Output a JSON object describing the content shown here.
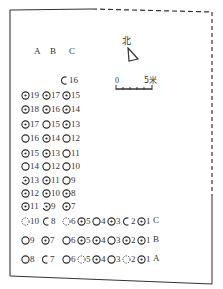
{
  "diagram": {
    "north_label": "北",
    "scale": {
      "start": "0",
      "end": "5米"
    },
    "column_headers": [
      "A",
      "B",
      "C"
    ],
    "row_labels": {
      "C": "C",
      "B": "B",
      "A": "A"
    },
    "vertical_rows": [
      {
        "y": 75,
        "cells": [
          {
            "col": "C",
            "x": 60,
            "n": "16",
            "type": "half"
          }
        ]
      },
      {
        "y": 90,
        "cells": [
          {
            "col": "A",
            "x": 21,
            "n": "19",
            "type": "dot"
          },
          {
            "col": "B",
            "x": 42,
            "n": "17",
            "type": "dot"
          },
          {
            "col": "C",
            "x": 62,
            "n": "15",
            "type": "dot"
          }
        ]
      },
      {
        "y": 104,
        "cells": [
          {
            "col": "A",
            "x": 21,
            "n": "18",
            "type": "dot"
          },
          {
            "col": "B",
            "x": 42,
            "n": "16",
            "type": "dot"
          },
          {
            "col": "C",
            "x": 62,
            "n": "14",
            "type": "dot"
          }
        ]
      },
      {
        "y": 119,
        "cells": [
          {
            "col": "A",
            "x": 21,
            "n": "17",
            "type": "dot"
          },
          {
            "col": "B",
            "x": 42,
            "n": "15",
            "type": "plain"
          },
          {
            "col": "C",
            "x": 62,
            "n": "13",
            "type": "dot"
          }
        ]
      },
      {
        "y": 133,
        "cells": [
          {
            "col": "A",
            "x": 21,
            "n": "16",
            "type": "plain"
          },
          {
            "col": "B",
            "x": 42,
            "n": "14",
            "type": "dot"
          },
          {
            "col": "C",
            "x": 62,
            "n": "12",
            "type": "plain"
          }
        ]
      },
      {
        "y": 148,
        "cells": [
          {
            "col": "A",
            "x": 21,
            "n": "15",
            "type": "dot"
          },
          {
            "col": "B",
            "x": 42,
            "n": "13",
            "type": "dot"
          },
          {
            "col": "C",
            "x": 62,
            "n": "11",
            "type": "plain"
          }
        ]
      },
      {
        "y": 161,
        "cells": [
          {
            "col": "A",
            "x": 21,
            "n": "14",
            "type": "plain"
          },
          {
            "col": "B",
            "x": 42,
            "n": "12",
            "type": "plain"
          },
          {
            "col": "C",
            "x": 62,
            "n": "10",
            "type": "plain"
          }
        ]
      },
      {
        "y": 175,
        "cells": [
          {
            "col": "A",
            "x": 21,
            "n": "13",
            "type": "brokendot"
          },
          {
            "col": "B",
            "x": 42,
            "n": "11",
            "type": "dot"
          },
          {
            "col": "C",
            "x": 62,
            "n": "9",
            "type": "plain"
          }
        ]
      },
      {
        "y": 188,
        "cells": [
          {
            "col": "A",
            "x": 21,
            "n": "12",
            "type": "dot"
          },
          {
            "col": "B",
            "x": 42,
            "n": "10",
            "type": "dot"
          },
          {
            "col": "C",
            "x": 62,
            "n": "8",
            "type": "dot"
          }
        ]
      },
      {
        "y": 201,
        "cells": [
          {
            "col": "A",
            "x": 21,
            "n": "11",
            "type": "dot"
          },
          {
            "col": "B",
            "x": 42,
            "n": "9",
            "type": "brokendot"
          },
          {
            "col": "C",
            "x": 62,
            "n": "7",
            "type": "dot"
          }
        ]
      }
    ],
    "horizontal_rows": [
      {
        "row": "C",
        "y": 216,
        "cells": [
          {
            "x": 21,
            "n": "10",
            "type": "dashed"
          },
          {
            "x": 42,
            "n": "8",
            "type": "half"
          },
          {
            "x": 62,
            "n": "6",
            "type": "dashed"
          },
          {
            "x": 77,
            "n": "5",
            "type": "dot"
          },
          {
            "x": 92,
            "n": "4",
            "type": "plain"
          },
          {
            "x": 107,
            "n": "3",
            "type": "dot"
          },
          {
            "x": 122,
            "n": "2",
            "type": "half"
          },
          {
            "x": 137,
            "n": "1",
            "type": "dot"
          }
        ]
      },
      {
        "row": "B",
        "y": 235,
        "cells": [
          {
            "x": 21,
            "n": "9",
            "type": "plain"
          },
          {
            "x": 41,
            "n": "7",
            "type": "dot"
          },
          {
            "x": 62,
            "n": "6",
            "type": "plain"
          },
          {
            "x": 77,
            "n": "5",
            "type": "dot"
          },
          {
            "x": 92,
            "n": "4",
            "type": "dot"
          },
          {
            "x": 107,
            "n": "3",
            "type": "plain"
          },
          {
            "x": 122,
            "n": "2",
            "type": "dot"
          },
          {
            "x": 137,
            "n": "1",
            "type": "dot"
          }
        ]
      },
      {
        "row": "A",
        "y": 254,
        "cells": [
          {
            "x": 21,
            "n": "8",
            "type": "plain"
          },
          {
            "x": 41,
            "n": "7",
            "type": "half"
          },
          {
            "x": 62,
            "n": "6",
            "type": "plain"
          },
          {
            "x": 77,
            "n": "5",
            "type": "dashed"
          },
          {
            "x": 92,
            "n": "4",
            "type": "dot"
          },
          {
            "x": 107,
            "n": "3",
            "type": "plain"
          },
          {
            "x": 122,
            "n": "2",
            "type": "dashed"
          },
          {
            "x": 137,
            "n": "1",
            "type": "dot"
          }
        ]
      }
    ]
  }
}
